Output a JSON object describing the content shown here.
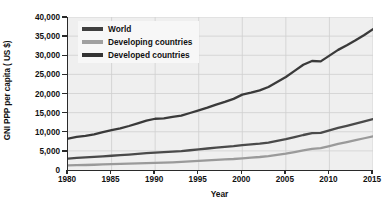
{
  "chart_data": {
    "type": "line",
    "title": "",
    "xlabel": "Year",
    "ylabel": "GNI PPP per capita ( US $)",
    "xlim": [
      1980,
      2015
    ],
    "ylim": [
      0,
      40000
    ],
    "grid": true,
    "legend_position": "top-left",
    "x_ticks": [
      "1980",
      "1985",
      "1990",
      "1995",
      "2000",
      "2005",
      "2010",
      "2015"
    ],
    "x_tick_values": [
      1980,
      1985,
      1990,
      1995,
      2000,
      2005,
      2010,
      2015
    ],
    "y_ticks": [
      "0",
      "5,000",
      "10,000",
      "15,000",
      "20,000",
      "25,000",
      "30,000",
      "35,000",
      "40,000"
    ],
    "y_tick_values": [
      0,
      5000,
      10000,
      15000,
      20000,
      25000,
      30000,
      35000,
      40000
    ],
    "x": [
      1980,
      1981,
      1982,
      1983,
      1984,
      1985,
      1986,
      1987,
      1988,
      1989,
      1990,
      1991,
      1992,
      1993,
      1994,
      1995,
      1996,
      1997,
      1998,
      1999,
      2000,
      2001,
      2002,
      2003,
      2004,
      2005,
      2006,
      2007,
      2008,
      2009,
      2010,
      2011,
      2012,
      2013,
      2014,
      2015
    ],
    "series": [
      {
        "name": "World",
        "color": "#4a4a4a",
        "values": [
          3000,
          3150,
          3280,
          3420,
          3580,
          3720,
          3870,
          4030,
          4220,
          4400,
          4560,
          4680,
          4820,
          4960,
          5160,
          5380,
          5620,
          5860,
          6020,
          6230,
          6520,
          6700,
          6900,
          7180,
          7620,
          8060,
          8580,
          9150,
          9620,
          9700,
          10350,
          11000,
          11550,
          12100,
          12700,
          13300
        ]
      },
      {
        "name": "Developing countries",
        "color": "#9a9a9a",
        "values": [
          1200,
          1260,
          1310,
          1370,
          1450,
          1510,
          1580,
          1650,
          1740,
          1810,
          1870,
          1930,
          2010,
          2110,
          2230,
          2360,
          2510,
          2660,
          2760,
          2880,
          3060,
          3220,
          3400,
          3640,
          3960,
          4300,
          4700,
          5150,
          5520,
          5720,
          6260,
          6820,
          7300,
          7800,
          8300,
          8800
        ]
      },
      {
        "name": "Developed countries",
        "color": "#3a3a3a",
        "values": [
          8200,
          8650,
          8900,
          9300,
          9900,
          10400,
          10900,
          11500,
          12200,
          12900,
          13400,
          13500,
          13900,
          14200,
          14900,
          15600,
          16300,
          17100,
          17800,
          18600,
          19700,
          20200,
          20800,
          21700,
          23000,
          24300,
          25900,
          27500,
          28500,
          28400,
          29900,
          31400,
          32600,
          33900,
          35300,
          36800
        ]
      }
    ],
    "legend": [
      {
        "label": "World",
        "color": "#3f3f3f"
      },
      {
        "label": "Developing countries",
        "color": "#a0a0a0"
      },
      {
        "label": "Developed countries",
        "color": "#333333"
      }
    ]
  }
}
